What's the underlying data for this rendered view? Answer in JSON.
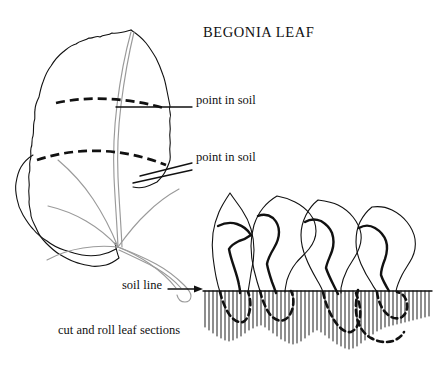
{
  "figure": {
    "title": "BEGONIA LEAF",
    "caption": "cut and roll leaf sections",
    "style": {
      "background": "#ffffff",
      "ink": "#111111",
      "vein_ink": "#808080",
      "line_art": "black-and-white"
    }
  },
  "labels": {
    "point_in_soil_upper": "point in soil",
    "point_in_soil_lower": "point in soil",
    "soil_line": "soil line"
  },
  "annotations": {
    "cut_lines": [
      {
        "name": "upper-cut-line",
        "label": "point in soil",
        "style": "dashed"
      },
      {
        "name": "lower-cut-line",
        "label": "point in soil",
        "style": "dashed"
      }
    ],
    "leader_lines": 2,
    "soil_line_arrow": "→"
  },
  "diagram": {
    "leaf": {
      "name": "begonia-leaf",
      "outline": "scalloped",
      "veins": 6,
      "petiole": "lower-right"
    },
    "sections": [
      {
        "name": "rolled-section-1",
        "buried": true
      },
      {
        "name": "rolled-section-2",
        "buried": true
      },
      {
        "name": "rolled-section-3",
        "buried": true
      },
      {
        "name": "rolled-section-4",
        "buried": true
      }
    ],
    "soil": {
      "name": "soil-hatching",
      "hatch_lines": 60,
      "line_y": 291
    }
  }
}
